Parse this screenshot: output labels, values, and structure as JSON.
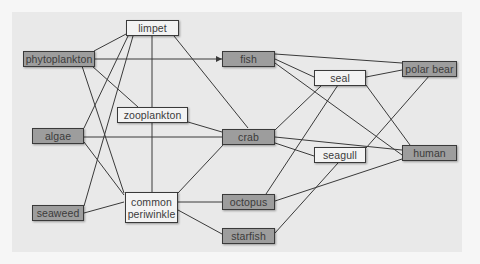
{
  "colors": {
    "page_bg": "#f6f6f6",
    "panel_bg": "#e9e9e9",
    "dark_node": "#9d9d9d",
    "light_node": "#f3f3f3",
    "edge": "#3a3a3a"
  },
  "diagram": {
    "type": "food-web",
    "nodes": {
      "phytoplankton": "phytoplankton",
      "algae": "algae",
      "seaweed": "seaweed",
      "limpet": "limpet",
      "zooplankton": "zooplankton",
      "common_periwinkle_line1": "common",
      "common_periwinkle_line2": "periwinkle",
      "fish": "fish",
      "crab": "crab",
      "octopus": "octopus",
      "starfish": "starfish",
      "seal": "seal",
      "seagull": "seagull",
      "polar_bear": "polar bear",
      "human": "human"
    },
    "edges": [
      [
        "phytoplankton",
        "limpet"
      ],
      [
        "phytoplankton",
        "fish"
      ],
      [
        "phytoplankton",
        "zooplankton"
      ],
      [
        "phytoplankton",
        "common periwinkle"
      ],
      [
        "algae",
        "limpet"
      ],
      [
        "algae",
        "crab"
      ],
      [
        "algae",
        "common periwinkle"
      ],
      [
        "seaweed",
        "limpet"
      ],
      [
        "seaweed",
        "common periwinkle"
      ],
      [
        "limpet",
        "zooplankton"
      ],
      [
        "limpet",
        "crab"
      ],
      [
        "zooplankton",
        "crab"
      ],
      [
        "common periwinkle",
        "crab"
      ],
      [
        "common periwinkle",
        "octopus"
      ],
      [
        "common periwinkle",
        "starfish"
      ],
      [
        "fish",
        "polar bear"
      ],
      [
        "fish",
        "seal"
      ],
      [
        "fish",
        "human"
      ],
      [
        "crab",
        "seal"
      ],
      [
        "crab",
        "seagull"
      ],
      [
        "crab",
        "human"
      ],
      [
        "octopus",
        "seal"
      ],
      [
        "octopus",
        "human"
      ],
      [
        "starfish",
        "seagull"
      ],
      [
        "seal",
        "polar bear"
      ],
      [
        "seal",
        "human"
      ],
      [
        "seagull",
        "polar bear"
      ]
    ]
  }
}
